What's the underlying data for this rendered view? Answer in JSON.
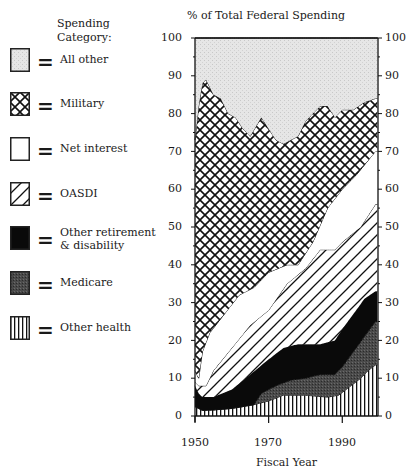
{
  "chart_data": {
    "type": "area",
    "stacked": true,
    "title": "% of Total Federal Spending",
    "xlabel": "Fiscal Year",
    "ylabel": "% of Total Federal Spending",
    "xlim": [
      1950,
      1999
    ],
    "ylim": [
      0,
      100
    ],
    "x_ticks": [
      1950,
      1970,
      1990
    ],
    "y_ticks": [
      0,
      10,
      20,
      30,
      40,
      50,
      60,
      70,
      80,
      90,
      100
    ],
    "y_axis_both_sides": true,
    "grid": false,
    "legend_position": "left",
    "legend_title": "Spending Category:",
    "note": "Values are cumulative (stacked) tops of each layer, read from the figure.",
    "series": [
      {
        "name": "Other health",
        "pattern": "vertical-lines",
        "cumulative_top": {
          "x": [
            1950,
            1951,
            1952,
            1955,
            1960,
            1966,
            1970,
            1974,
            1980,
            1986,
            1989,
            1991,
            1993,
            1995,
            1997,
            1999
          ],
          "y": [
            2.5,
            2,
            1.5,
            1.6,
            2,
            3,
            4,
            5.5,
            5.5,
            5,
            5.5,
            7,
            8.5,
            10,
            12,
            13.5
          ]
        }
      },
      {
        "name": "Medicare",
        "pattern": "dark-gray-stipple",
        "cumulative_top": {
          "x": [
            1966,
            1968,
            1970,
            1972,
            1976,
            1980,
            1984,
            1988,
            1990,
            1993,
            1996,
            1999
          ],
          "y": [
            3,
            6,
            7,
            8,
            9.5,
            10,
            11,
            11,
            13,
            17,
            21,
            25
          ]
        }
      },
      {
        "name": "Other retirement & disability",
        "pattern": "solid-black",
        "cumulative_top": {
          "x": [
            1950,
            1951,
            1952,
            1955,
            1960,
            1965,
            1970,
            1974,
            1978,
            1984,
            1988,
            1990,
            1993,
            1996,
            1999
          ],
          "y": [
            8,
            6,
            5,
            5,
            7,
            11,
            15,
            18,
            19,
            19,
            20,
            23,
            27,
            31,
            33
          ]
        }
      },
      {
        "name": "OASDI",
        "pattern": "diagonal-lines",
        "cumulative_top": {
          "x": [
            1950,
            1951,
            1953,
            1955,
            1960,
            1965,
            1970,
            1975,
            1980,
            1984,
            1988,
            1990,
            1995,
            1999
          ],
          "y": [
            9,
            8,
            8,
            12,
            18,
            24,
            28,
            35,
            39,
            44,
            44,
            46,
            50,
            56
          ]
        }
      },
      {
        "name": "Net interest",
        "pattern": "white",
        "cumulative_top": {
          "x": [
            1950,
            1951,
            1952,
            1954,
            1958,
            1962,
            1966,
            1970,
            1975,
            1978,
            1982,
            1986,
            1990,
            1994,
            1999
          ],
          "y": [
            12,
            10,
            17,
            22,
            27,
            32,
            34,
            38,
            40,
            40,
            46,
            55,
            60,
            64,
            70
          ]
        }
      },
      {
        "name": "Military",
        "pattern": "cross-hatch",
        "cumulative_top": {
          "x": [
            1950,
            1951,
            1952,
            1953,
            1955,
            1957,
            1959,
            1961,
            1963,
            1965,
            1968,
            1970,
            1972,
            1974,
            1976,
            1978,
            1980,
            1982,
            1984,
            1986,
            1988,
            1990,
            1993,
            1996,
            1999
          ],
          "y": [
            73,
            82,
            88,
            89,
            85,
            84,
            80,
            79,
            76,
            74,
            79,
            76,
            73,
            72,
            73,
            74,
            78,
            80,
            82,
            82,
            79,
            81,
            81,
            83,
            84
          ]
        }
      },
      {
        "name": "All other",
        "pattern": "light-gray-stipple",
        "cumulative_top": {
          "x": [
            1950,
            1999
          ],
          "y": [
            100,
            100
          ]
        }
      }
    ]
  },
  "legend": {
    "title_line1": "Spending",
    "title_line2": "Category:",
    "equals": "=",
    "items": [
      {
        "label": "All other"
      },
      {
        "label": "Military"
      },
      {
        "label": "Net interest"
      },
      {
        "label": "OASDI"
      },
      {
        "label": "Other retirement",
        "label2": "& disability"
      },
      {
        "label": "Medicare"
      },
      {
        "label": "Other health"
      }
    ]
  },
  "axes": {
    "title": "% of Total Federal Spending",
    "xlabel": "Fiscal Year",
    "y_ticks": [
      "100",
      "90",
      "80",
      "70",
      "60",
      "50",
      "40",
      "30",
      "20",
      "10",
      "0"
    ],
    "x_ticks": [
      "1950",
      "1970",
      "1990"
    ]
  }
}
